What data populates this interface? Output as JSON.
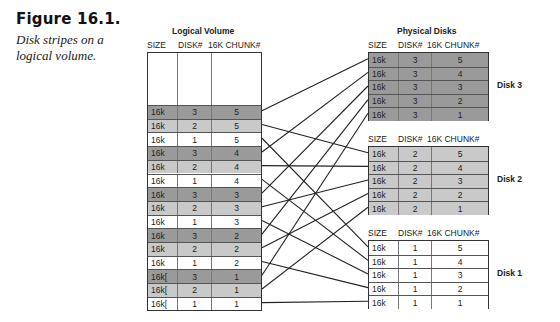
{
  "caption": {
    "title": "Figure 16.1.",
    "description": "Disk stripes on a logical volume."
  },
  "logical_volume": {
    "title": "Logical Volume",
    "columns": [
      "SIZE",
      "DISK#",
      "16K CHUNK#"
    ],
    "rows": [
      {
        "size": "16k",
        "disk": "3",
        "chunk": "5"
      },
      {
        "size": "16k",
        "disk": "2",
        "chunk": "5"
      },
      {
        "size": "16k",
        "disk": "1",
        "chunk": "5"
      },
      {
        "size": "16k",
        "disk": "3",
        "chunk": "4"
      },
      {
        "size": "16k",
        "disk": "2",
        "chunk": "4"
      },
      {
        "size": "16k",
        "disk": "1",
        "chunk": "4"
      },
      {
        "size": "16k",
        "disk": "3",
        "chunk": "3"
      },
      {
        "size": "16k",
        "disk": "2",
        "chunk": "3"
      },
      {
        "size": "16k",
        "disk": "1",
        "chunk": "3"
      },
      {
        "size": "16k",
        "disk": "3",
        "chunk": "2"
      },
      {
        "size": "16k",
        "disk": "2",
        "chunk": "2"
      },
      {
        "size": "16k",
        "disk": "1",
        "chunk": "2"
      },
      {
        "size": "16k[",
        "disk": "3",
        "chunk": "1"
      },
      {
        "size": "16k[",
        "disk": "2",
        "chunk": "1"
      },
      {
        "size": "16k[",
        "disk": "1",
        "chunk": "1"
      }
    ]
  },
  "physical_disks": {
    "title": "Physical Disks",
    "columns": [
      "SIZE",
      "DISK#",
      "16K CHUNK#"
    ],
    "disks": [
      {
        "label": "Disk 3",
        "rows": [
          {
            "size": "16k",
            "disk": "3",
            "chunk": "5"
          },
          {
            "size": "16k",
            "disk": "3",
            "chunk": "4"
          },
          {
            "size": "16k",
            "disk": "3",
            "chunk": "3"
          },
          {
            "size": "16k",
            "disk": "3",
            "chunk": "2"
          },
          {
            "size": "16k",
            "disk": "3",
            "chunk": "1"
          }
        ]
      },
      {
        "label": "Disk 2",
        "rows": [
          {
            "size": "16k",
            "disk": "2",
            "chunk": "5"
          },
          {
            "size": "16k",
            "disk": "2",
            "chunk": "4"
          },
          {
            "size": "16k",
            "disk": "2",
            "chunk": "3"
          },
          {
            "size": "16k",
            "disk": "2",
            "chunk": "2"
          },
          {
            "size": "16k",
            "disk": "2",
            "chunk": "1"
          }
        ]
      },
      {
        "label": "Disk 1",
        "rows": [
          {
            "size": "16k",
            "disk": "1",
            "chunk": "5"
          },
          {
            "size": "16k",
            "disk": "1",
            "chunk": "4"
          },
          {
            "size": "16k",
            "disk": "1",
            "chunk": "3"
          },
          {
            "size": "16k",
            "disk": "1",
            "chunk": "2"
          },
          {
            "size": "16k",
            "disk": "1",
            "chunk": "1"
          }
        ]
      }
    ]
  },
  "colors": {
    "disk3_fill": "#9a9a9a",
    "disk2_fill": "#c9c9c9",
    "disk1_fill": "#ffffff",
    "line": "#222222"
  }
}
